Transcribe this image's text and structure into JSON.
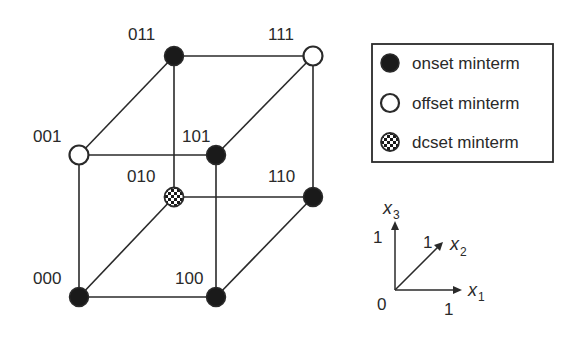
{
  "diagram": {
    "title": "",
    "vertices": [
      {
        "id": "000",
        "label": "000",
        "type": "onset"
      },
      {
        "id": "100",
        "label": "100",
        "type": "onset"
      },
      {
        "id": "001",
        "label": "001",
        "type": "offset"
      },
      {
        "id": "101",
        "label": "101",
        "type": "onset"
      },
      {
        "id": "010",
        "label": "010",
        "type": "dcset"
      },
      {
        "id": "110",
        "label": "110",
        "type": "onset"
      },
      {
        "id": "011",
        "label": "011",
        "type": "onset"
      },
      {
        "id": "111",
        "label": "111",
        "type": "offset"
      }
    ],
    "legend": {
      "onset": "onset minterm",
      "offset": "offset minterm",
      "dcset": "dcset minterm"
    },
    "axes": {
      "origin": "0",
      "x1": {
        "name": "x",
        "sub": "1",
        "tick": "1"
      },
      "x2": {
        "name": "x",
        "sub": "2",
        "tick": "1"
      },
      "x3": {
        "name": "x",
        "sub": "3",
        "tick": "1"
      }
    },
    "colors": {
      "line": "#2a2a2a",
      "onset_fill": "#1a1a1a",
      "offset_fill": "#ffffff"
    }
  }
}
